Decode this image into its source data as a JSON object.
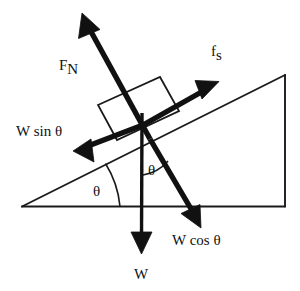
{
  "diagram": {
    "type": "physics-force-diagram",
    "background_color": "#ffffff",
    "line_color": "#1a1a1a",
    "vector_color": "#111111",
    "incline": {
      "name": "inclined-plane-triangle",
      "base_left": [
        22,
        206
      ],
      "base_right": [
        285,
        206
      ],
      "apex": [
        285,
        75
      ],
      "angle_label": "θ"
    },
    "block": {
      "name": "block-on-incline",
      "corners": [
        [
          98,
          105
        ],
        [
          160,
          77
        ],
        [
          179,
          111
        ],
        [
          117,
          140
        ]
      ]
    },
    "labels": {
      "normal_force": {
        "base": "F",
        "sub": "N"
      },
      "static_friction": {
        "base": "f",
        "sub": "s"
      },
      "weight_parallel": "W sin θ",
      "weight_perpendicular": "W cos θ",
      "weight": "W",
      "angle_base": "θ",
      "angle_vertical": "θ"
    },
    "vectors": [
      {
        "name": "normal-force-vector",
        "label": "F_N",
        "from": [
          143,
          125
        ],
        "to": [
          83,
          15
        ],
        "direction": "up-left, perpendicular to incline surface"
      },
      {
        "name": "static-friction-vector",
        "label": "f_s",
        "from": [
          143,
          125
        ],
        "to": [
          218,
          82
        ],
        "direction": "up-slope, parallel to incline surface"
      },
      {
        "name": "weight-parallel-vector",
        "label": "W sin θ",
        "from": [
          143,
          125
        ],
        "to": [
          74,
          150
        ],
        "direction": "down-slope, parallel to incline surface"
      },
      {
        "name": "weight-perpendicular-vector",
        "label": "W cos θ",
        "from": [
          143,
          125
        ],
        "to": [
          200,
          227
        ],
        "direction": "down-right, perpendicular into incline surface"
      },
      {
        "name": "weight-vector",
        "label": "W",
        "from": [
          143,
          113
        ],
        "to": [
          141,
          253
        ],
        "direction": "straight down (gravity)"
      }
    ]
  }
}
